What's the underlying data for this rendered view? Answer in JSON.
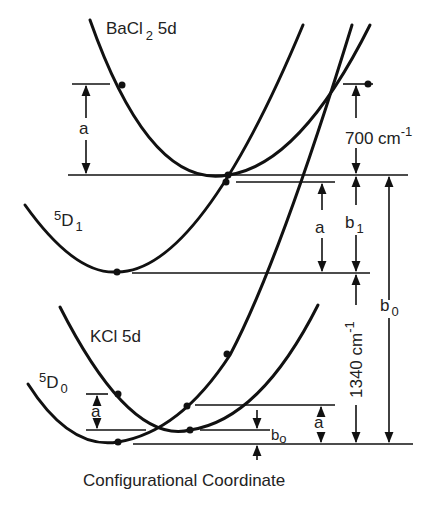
{
  "diagram": {
    "x_axis_label": "Configurational Coordinate",
    "curves": [
      {
        "id": "bacl2-5d",
        "label": "BaCl",
        "label_sub": "2",
        "label_suffix": " 5d"
      },
      {
        "id": "5d1",
        "label_sup": "5",
        "label": "D",
        "label_sub": "1"
      },
      {
        "id": "kcl-5d",
        "label": "KCl  5d"
      },
      {
        "id": "5d0",
        "label_sup": "5",
        "label": "D",
        "label_sub": "0"
      }
    ],
    "dimensions": {
      "a": "a",
      "b1": "b",
      "b1_sub": "1",
      "b0": "b",
      "b0_sub": "0",
      "bo_small": "b",
      "bo_small_sub": "o",
      "gap_700": "700 cm",
      "gap_700_sup": "-1",
      "gap_1340": "1340 cm",
      "gap_1340_sup": "-1"
    }
  }
}
